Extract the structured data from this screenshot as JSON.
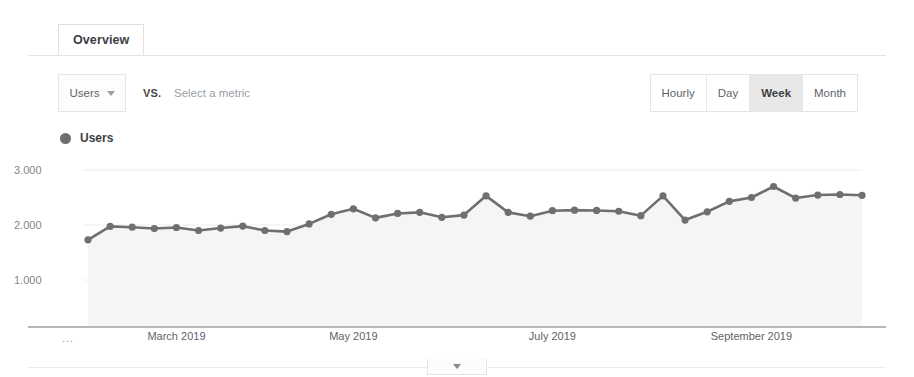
{
  "tabs": [
    {
      "label": "Overview",
      "active": true
    }
  ],
  "metric_row": {
    "primary_metric": "Users",
    "caret_icon": "chevron-down-icon",
    "vs_label": "VS.",
    "secondary_metric_placeholder": "Select a metric"
  },
  "granularity": {
    "options": [
      {
        "label": "Hourly",
        "selected": false
      },
      {
        "label": "Day",
        "selected": false
      },
      {
        "label": "Week",
        "selected": true
      },
      {
        "label": "Month",
        "selected": false
      }
    ]
  },
  "legend": [
    {
      "label": "Users",
      "color": "#6f6f6f"
    }
  ],
  "axis": {
    "ellipsis": "...",
    "y_ticks": [
      "3.000",
      "2.000",
      "1.000"
    ],
    "x_ticks": [
      "March 2019",
      "May 2019",
      "July 2019",
      "September 2019"
    ]
  },
  "collapse_tab": {
    "icon": "chevron-down-icon"
  },
  "colors": {
    "line": "#6f6f6f",
    "marker": "#6f6f6f",
    "area_fill": "#f5f5f5",
    "gridline": "#ececec",
    "axis": "#9aa0a6",
    "tab_border": "#e0e0e0",
    "selected_segment": "#e8e8e8"
  },
  "chart_data": {
    "type": "line",
    "title": "Users",
    "xlabel": "",
    "ylabel": "Users",
    "ylim": [
      0,
      3500
    ],
    "y_ticks": [
      1000,
      2000,
      3000
    ],
    "y_tick_labels": [
      "1.000",
      "2.000",
      "3.000"
    ],
    "grid": true,
    "legend_position": "top-left",
    "x_tick_labels": [
      "March 2019",
      "May 2019",
      "July 2019",
      "September 2019"
    ],
    "x_tick_indices": [
      4,
      12,
      21,
      30
    ],
    "series": [
      {
        "name": "Users",
        "color": "#6f6f6f",
        "x": [
          "Feb 3, 2019",
          "Feb 10, 2019",
          "Feb 17, 2019",
          "Feb 24, 2019",
          "Mar 3, 2019",
          "Mar 10, 2019",
          "Mar 17, 2019",
          "Mar 24, 2019",
          "Mar 31, 2019",
          "Apr 7, 2019",
          "Apr 14, 2019",
          "Apr 21, 2019",
          "Apr 28, 2019",
          "May 5, 2019",
          "May 12, 2019",
          "May 19, 2019",
          "May 26, 2019",
          "Jun 2, 2019",
          "Jun 9, 2019",
          "Jun 16, 2019",
          "Jun 23, 2019",
          "Jun 30, 2019",
          "Jul 7, 2019",
          "Jul 14, 2019",
          "Jul 21, 2019",
          "Jul 28, 2019",
          "Aug 4, 2019",
          "Aug 11, 2019",
          "Aug 18, 2019",
          "Aug 25, 2019",
          "Sep 1, 2019",
          "Sep 8, 2019",
          "Sep 15, 2019",
          "Sep 22, 2019",
          "Sep 29, 2019",
          "Oct 6, 2019"
        ],
        "values": [
          1730,
          1975,
          1960,
          1935,
          1955,
          1900,
          1945,
          1980,
          1900,
          1880,
          2020,
          2195,
          2295,
          2130,
          2210,
          2230,
          2140,
          2180,
          2530,
          2230,
          2160,
          2260,
          2270,
          2265,
          2250,
          2170,
          2530,
          2090,
          2240,
          2430,
          2500,
          2700,
          2490,
          2545,
          2555,
          2540
        ]
      }
    ]
  },
  "chart_geometry": {
    "plot_left": 88,
    "plot_right": 862,
    "plot_top": 0,
    "plot_bottom": 172,
    "y_pixel_3000": 15,
    "y_pixel_2000": 70,
    "y_pixel_1000": 125,
    "point_count": 36
  }
}
